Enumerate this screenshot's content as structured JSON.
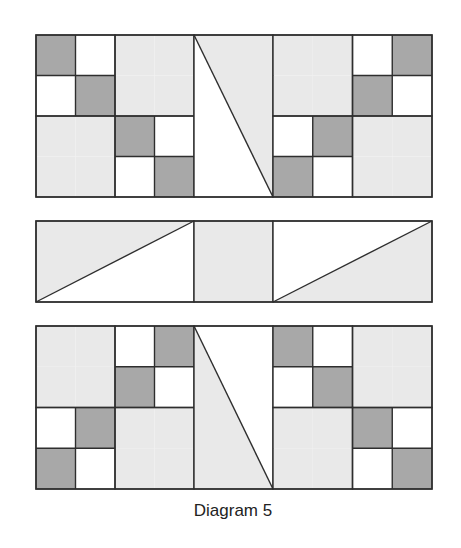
{
  "caption": "Diagram 5",
  "colors": {
    "dark": "#a8a8a8",
    "light": "#e9e9e9",
    "white": "#ffffff",
    "line": "#2e2e2e"
  },
  "rows": [
    {
      "name": "top-row",
      "blocks": [
        {
          "type": "four-patch",
          "cells": [
            [
              "dark",
              "white",
              "light",
              "light"
            ],
            [
              "white",
              "dark",
              "light",
              "light"
            ],
            [
              "light",
              "light",
              "dark",
              "white"
            ],
            [
              "light",
              "light",
              "white",
              "dark"
            ]
          ]
        },
        {
          "type": "tall-triangle",
          "left": "white",
          "right": "light",
          "diagonal": "top-left-to-bottom-right"
        },
        {
          "type": "four-patch",
          "cells": [
            [
              "light",
              "light",
              "white",
              "dark"
            ],
            [
              "light",
              "light",
              "dark",
              "white"
            ],
            [
              "white",
              "dark",
              "light",
              "light"
            ],
            [
              "dark",
              "white",
              "light",
              "light"
            ]
          ]
        }
      ]
    },
    {
      "name": "middle-row",
      "blocks": [
        {
          "type": "wide-triangle",
          "upper": "light",
          "lower": "white",
          "diagonal": "bottom-left-to-top-right"
        },
        {
          "type": "square",
          "fill": "light"
        },
        {
          "type": "wide-triangle",
          "upper": "white",
          "lower": "light",
          "diagonal": "bottom-left-to-top-right"
        }
      ]
    },
    {
      "name": "bottom-row",
      "blocks": [
        {
          "type": "four-patch",
          "cells": [
            [
              "light",
              "light",
              "white",
              "dark"
            ],
            [
              "light",
              "light",
              "dark",
              "white"
            ],
            [
              "white",
              "dark",
              "light",
              "light"
            ],
            [
              "dark",
              "white",
              "light",
              "light"
            ]
          ]
        },
        {
          "type": "tall-triangle",
          "left": "light",
          "right": "white",
          "diagonal": "top-left-to-bottom-right"
        },
        {
          "type": "four-patch",
          "cells": [
            [
              "dark",
              "white",
              "light",
              "light"
            ],
            [
              "white",
              "dark",
              "light",
              "light"
            ],
            [
              "light",
              "light",
              "dark",
              "white"
            ],
            [
              "light",
              "light",
              "white",
              "dark"
            ]
          ]
        }
      ]
    }
  ]
}
